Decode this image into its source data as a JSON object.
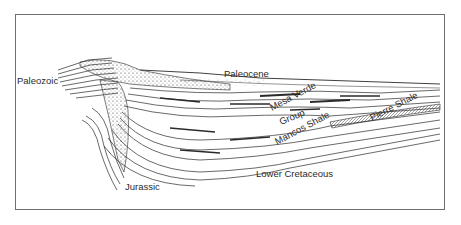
{
  "diagram": {
    "type": "geologic-cross-section",
    "labels": {
      "paleozoic": "Paleozoic",
      "paleocene": "Paleocene",
      "mesa_verde": "Mesa Verde",
      "group": "Group",
      "pierre_shale": "Pierre Shale",
      "mancos_shale": "Mancos Shale",
      "lower_cretaceous": "Lower Cretaceous",
      "jurassic": "Jurassic"
    },
    "colors": {
      "line": "#2a2a2a",
      "frame": "#6e6e6e",
      "background": "#ffffff"
    }
  }
}
